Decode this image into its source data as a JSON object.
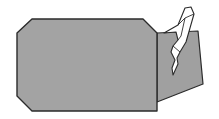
{
  "diagram": {
    "type": "origami-fold-diagram",
    "colors": {
      "background": "#ffffff",
      "paper_colored": "#a3a3a3",
      "paper_back": "#a0a0a0",
      "paper_white": "#ffffff",
      "outline": "#2b2b2b"
    },
    "shapes": {
      "back_flap": "157,33 198,31 203,84 157,102",
      "main_body": "32,19 143,19 157,33 157,111 32,111 17,96 17,33",
      "white_fold_outer": "164,33 178,25 185,8 191,7 194,14 190,28 186,42 180,52 177,58 178,64 173,75 172,68 175,60 171,52 173,46 178,40 176,32 164,33",
      "white_fold_crease_1": "178,25 185,18 194,14",
      "white_fold_crease_2": "185,18 181,36 178,40",
      "white_fold_crease_3": "173,46 180,52"
    }
  }
}
